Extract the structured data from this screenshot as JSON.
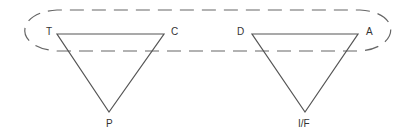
{
  "diagram": {
    "grouping": {
      "shape": "dashed-ellipse",
      "encloses": [
        "T",
        "C",
        "D",
        "A"
      ]
    },
    "triangles": [
      {
        "name": "left-triangle",
        "vertices": {
          "top_left": "T",
          "top_right": "C",
          "bottom": "P"
        }
      },
      {
        "name": "right-triangle",
        "vertices": {
          "top_left": "D",
          "top_right": "A",
          "bottom": "I/F"
        }
      }
    ],
    "labels": {
      "t": "T",
      "c": "C",
      "p": "P",
      "d": "D",
      "a": "A",
      "if": "I/F"
    },
    "colors": {
      "stroke": "#555555",
      "dash": "#666666",
      "text": "#333333"
    }
  }
}
